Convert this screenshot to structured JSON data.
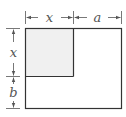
{
  "diagram": {
    "labels": {
      "top_left": "x",
      "top_right": "a",
      "left_top": "x",
      "left_bottom": "b"
    },
    "colors": {
      "stroke": "#333333",
      "dimension": "#555555",
      "shaded_fill": "#f0f0f0",
      "background": "#ffffff"
    }
  }
}
